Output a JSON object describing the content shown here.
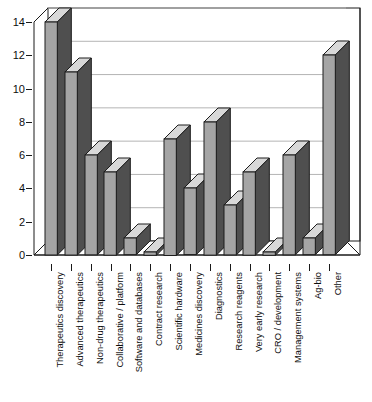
{
  "chart_data": {
    "type": "bar",
    "title": "",
    "subtitle": "",
    "xlabel": "",
    "ylabel": "",
    "ylim": [
      0,
      14
    ],
    "ytick_step": 2,
    "yticks": [
      0,
      2,
      4,
      6,
      8,
      10,
      12,
      14
    ],
    "grid": true,
    "grid_axis": "y",
    "legend": false,
    "style": "3d-bar",
    "bar_face_color": "#a5a5a5",
    "bar_side_color": "#4f4f4f",
    "bar_top_color": "#d8d8d8",
    "bar_edge_color": "#1c1c1c",
    "axis_color": "#1a1a1a",
    "grid_color": "#b4b4b4",
    "background_color": "#ffffff",
    "categories": [
      "Therapeutics discovery",
      "Advanced therapeutics",
      "Non-drug therapeutics",
      "Collaborative / platform",
      "Software and databases",
      "Contract research",
      "Scientific hardware",
      "Medicines discovery",
      "Diagnostics",
      "Research reagents",
      "Very early research",
      "CRO / development",
      "Management systems",
      "Ag-bio",
      "Other"
    ],
    "values": [
      14,
      11,
      6,
      5,
      1,
      0.2,
      7,
      4,
      8,
      3,
      5,
      0.2,
      6,
      1,
      12
    ]
  }
}
